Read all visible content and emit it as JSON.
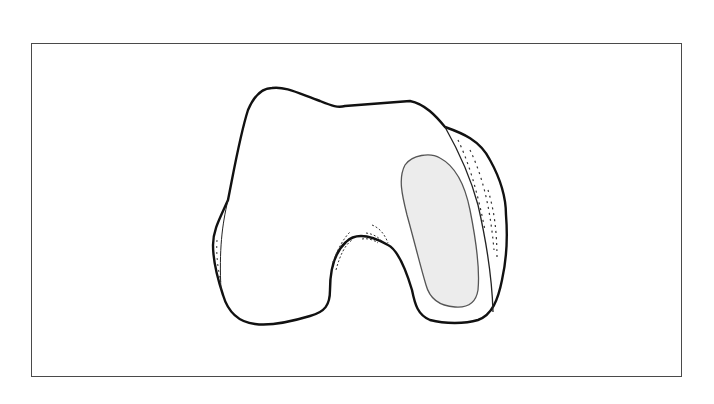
{
  "figure": {
    "frame_color": "#4a4a4a",
    "outline_color": "#111111",
    "shaded_region_fill": "#ececec",
    "shaded_region_stroke": "#555555",
    "background": "#ffffff"
  }
}
